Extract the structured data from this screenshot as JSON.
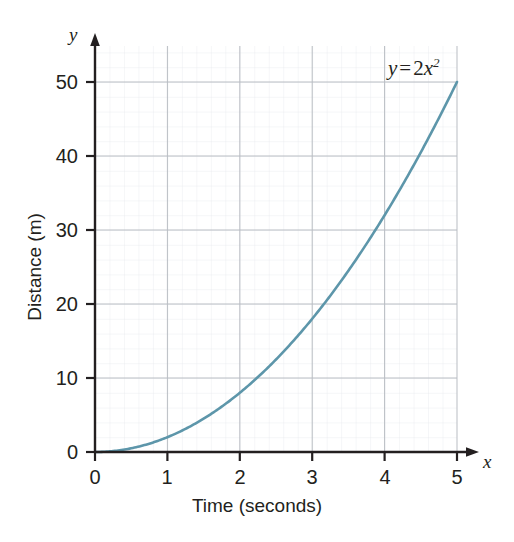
{
  "chart_data": {
    "type": "line",
    "title": "",
    "equation_label": "y = 2x²",
    "equation_parts": {
      "lhs": "y",
      "operator": "=",
      "coefficient": "2",
      "variable": "x",
      "exponent": "2"
    },
    "xlabel": "Time (seconds)",
    "ylabel": "Distance (m)",
    "x_axis_name": "x",
    "y_axis_name": "y",
    "xlim": [
      0,
      5
    ],
    "ylim": [
      0,
      50
    ],
    "xticks": [
      0,
      1,
      2,
      3,
      4,
      5
    ],
    "yticks": [
      0,
      10,
      20,
      30,
      40,
      50
    ],
    "xtick_labels": [
      "0",
      "1",
      "2",
      "3",
      "4",
      "5"
    ],
    "ytick_labels": [
      "0",
      "10",
      "20",
      "30",
      "40",
      "50"
    ],
    "grid": true,
    "grid_minor_divisions_x": 5,
    "grid_minor_divisions_y": 5,
    "legend": "none",
    "series": [
      {
        "name": "y = 2x²",
        "color": "#5d96aa",
        "x": [
          0,
          0.25,
          0.5,
          0.75,
          1,
          1.25,
          1.5,
          1.75,
          2,
          2.25,
          2.5,
          2.75,
          3,
          3.25,
          3.5,
          3.75,
          4,
          4.25,
          4.5,
          4.75,
          5
        ],
        "values": [
          0,
          0.125,
          0.5,
          1.125,
          2,
          3.125,
          4.5,
          6.125,
          8,
          10.125,
          12.5,
          15.125,
          18,
          21.125,
          24.5,
          28.125,
          32,
          36.125,
          40.5,
          45.125,
          50
        ]
      }
    ],
    "annotations": [
      {
        "text": "y = 2x²",
        "x": 4.45,
        "y": 52.5
      }
    ]
  },
  "colors": {
    "curve": "#5d96aa",
    "axis": "#231f20",
    "grid_major": "#b8bcc2",
    "grid_minor": "#e2e5e9",
    "text": "#231f20",
    "background": "#ffffff"
  }
}
